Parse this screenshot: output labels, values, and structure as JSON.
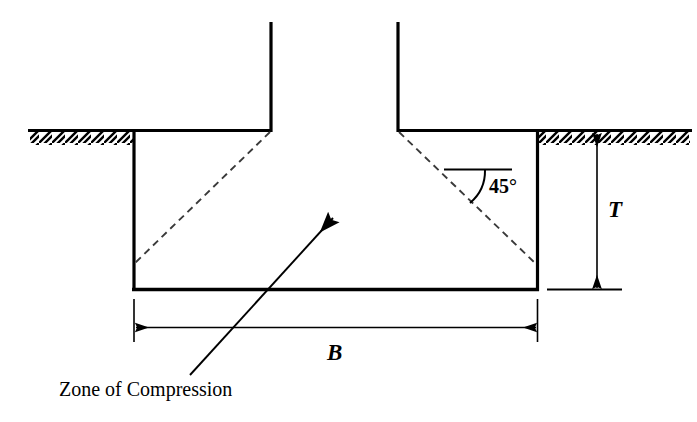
{
  "figure": {
    "type": "engineering-section-diagram",
    "background_color": "#ffffff",
    "line_color": "#000000",
    "width": 697,
    "height": 422
  },
  "labels": {
    "depth": "T",
    "width": "B",
    "angle": "45°",
    "zone": "Zone of Compression"
  },
  "geometry": {
    "column": {
      "left_wall_x": 270,
      "right_wall_x": 398,
      "top_y": 22,
      "bottom_y": 131
    },
    "footing": {
      "left_x": 133,
      "right_x": 538,
      "top_y": 131,
      "bottom_y": 290
    },
    "ground_line_y": 131,
    "hatch_left": {
      "x1": 30,
      "x2": 133
    },
    "hatch_right": {
      "x1": 538,
      "x2": 690
    },
    "dashed_left": {
      "x1": 270,
      "y1": 131,
      "x2": 135,
      "y2": 262
    },
    "dashed_right": {
      "x1": 398,
      "y1": 131,
      "x2": 535,
      "y2": 262
    },
    "dimension_T": {
      "x": 597,
      "y1": 131,
      "y2": 290
    },
    "dimension_B": {
      "y": 328,
      "x1": 133,
      "x2": 538
    },
    "leader": {
      "tip_x": 333,
      "tip_y": 218,
      "tail_x": 190,
      "tail_y": 375
    },
    "angle_arc_vertex": {
      "x": 470,
      "y": 204
    }
  }
}
